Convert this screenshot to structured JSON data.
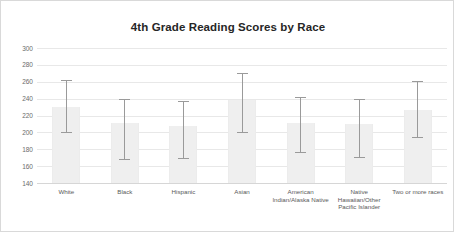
{
  "chart_data": {
    "type": "bar",
    "title": "4th Grade Reading Scores by Race",
    "xlabel": "",
    "ylabel": "",
    "ylim": [
      140,
      300
    ],
    "ytick_step": 20,
    "yticks": [
      300,
      280,
      260,
      240,
      220,
      200,
      180,
      160,
      140
    ],
    "grid": true,
    "legend": "none",
    "categories": [
      "White",
      "Black",
      "Hispanic",
      "Asian",
      "American Indian/Alaska Native",
      "Native Hawaiian/Other Pacific Islander",
      "Two or more races"
    ],
    "values": [
      230,
      211,
      207,
      238,
      211,
      210,
      227
    ],
    "error_high": [
      262,
      240,
      237,
      270,
      242,
      240,
      261
    ],
    "error_low": [
      200,
      168,
      170,
      201,
      177,
      171,
      195
    ],
    "bar_color": "#efefef",
    "error_bar_color": "#9a9a9a",
    "grid_color": "#e8e8e8",
    "title_color": "#262626"
  }
}
